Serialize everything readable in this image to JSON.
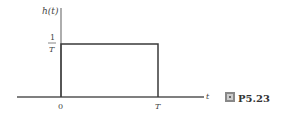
{
  "diagram": {
    "y_axis_label": "h(t)",
    "x_axis_label": "t",
    "level_label": {
      "numerator": "1",
      "denominator": "T"
    },
    "tick_labels": [
      "0",
      "T"
    ],
    "figure_label": {
      "icon": "figure-icon",
      "text": "P5.23"
    },
    "colors": {
      "line": "#4a4a4a",
      "axis": "#6a6a6a",
      "text": "#444444"
    }
  }
}
